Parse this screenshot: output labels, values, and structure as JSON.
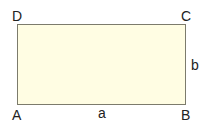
{
  "diagram": {
    "shape": "rectangle",
    "fill_color": "#fffde3",
    "stroke_color": "#7c7b6c",
    "vertices": {
      "top_left": "D",
      "top_right": "C",
      "bottom_right": "B",
      "bottom_left": "A"
    },
    "sides": {
      "bottom": "a",
      "right": "b"
    }
  }
}
